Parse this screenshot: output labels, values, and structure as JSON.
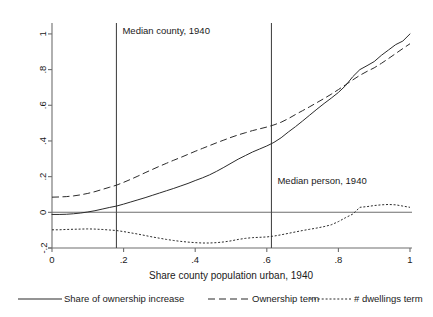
{
  "chart_data": {
    "type": "line",
    "title": "",
    "xlabel": "Share county population urban, 1940",
    "ylabel": "",
    "xlim": [
      0,
      1
    ],
    "ylim": [
      -0.2,
      1.05
    ],
    "grid": false,
    "legend_position": "bottom",
    "xticks": [
      "0",
      ".2",
      ".4",
      ".6",
      ".8",
      "1"
    ],
    "xtick_values": [
      0,
      0.2,
      0.4,
      0.6,
      0.8,
      1
    ],
    "yticks": [
      "-.2",
      "0",
      ".2",
      ".4",
      ".6",
      ".8",
      "1"
    ],
    "ytick_values": [
      -0.2,
      0,
      0.2,
      0.4,
      0.6,
      0.8,
      1
    ],
    "zero_line": 0,
    "annotations": [
      {
        "label": "Median county, 1940",
        "x": 0.18,
        "line": true
      },
      {
        "label": "Median person, 1940",
        "x": 0.613,
        "line": true
      }
    ],
    "x": [
      0,
      0.02,
      0.04,
      0.06,
      0.08,
      0.1,
      0.12,
      0.14,
      0.16,
      0.18,
      0.2,
      0.22,
      0.24,
      0.26,
      0.28,
      0.3,
      0.32,
      0.34,
      0.36,
      0.38,
      0.4,
      0.42,
      0.44,
      0.46,
      0.48,
      0.5,
      0.52,
      0.54,
      0.56,
      0.58,
      0.6,
      0.62,
      0.64,
      0.66,
      0.68,
      0.7,
      0.72,
      0.74,
      0.76,
      0.78,
      0.8,
      0.82,
      0.84,
      0.86,
      0.88,
      0.9,
      0.92,
      0.94,
      0.96,
      0.98,
      1
    ],
    "series": [
      {
        "name": "Share of ownership increase",
        "style": "solid",
        "values": [
          -0.012,
          -0.012,
          -0.011,
          -0.008,
          -0.004,
          0.002,
          0.009,
          0.018,
          0.027,
          0.035,
          0.046,
          0.058,
          0.07,
          0.082,
          0.095,
          0.108,
          0.121,
          0.134,
          0.148,
          0.162,
          0.178,
          0.193,
          0.21,
          0.23,
          0.252,
          0.275,
          0.298,
          0.318,
          0.338,
          0.355,
          0.372,
          0.392,
          0.418,
          0.45,
          0.48,
          0.512,
          0.545,
          0.578,
          0.61,
          0.64,
          0.672,
          0.71,
          0.76,
          0.8,
          0.822,
          0.845,
          0.88,
          0.91,
          0.94,
          0.96,
          1.0
        ]
      },
      {
        "name": "Ownership term",
        "style": "dashed",
        "values": [
          0.085,
          0.086,
          0.088,
          0.092,
          0.098,
          0.106,
          0.116,
          0.128,
          0.14,
          0.152,
          0.168,
          0.185,
          0.203,
          0.222,
          0.24,
          0.258,
          0.275,
          0.292,
          0.308,
          0.325,
          0.342,
          0.358,
          0.374,
          0.39,
          0.405,
          0.42,
          0.434,
          0.446,
          0.458,
          0.468,
          0.478,
          0.49,
          0.505,
          0.525,
          0.548,
          0.57,
          0.592,
          0.615,
          0.638,
          0.662,
          0.688,
          0.715,
          0.742,
          0.768,
          0.79,
          0.81,
          0.835,
          0.862,
          0.89,
          0.918,
          0.945
        ]
      },
      {
        "name": "# dwellings term",
        "style": "dotted",
        "values": [
          -0.098,
          -0.098,
          -0.096,
          -0.095,
          -0.094,
          -0.093,
          -0.094,
          -0.096,
          -0.099,
          -0.102,
          -0.108,
          -0.115,
          -0.122,
          -0.13,
          -0.138,
          -0.145,
          -0.152,
          -0.158,
          -0.163,
          -0.167,
          -0.17,
          -0.172,
          -0.172,
          -0.17,
          -0.166,
          -0.16,
          -0.152,
          -0.146,
          -0.142,
          -0.14,
          -0.138,
          -0.133,
          -0.126,
          -0.118,
          -0.11,
          -0.102,
          -0.095,
          -0.088,
          -0.08,
          -0.07,
          -0.052,
          -0.03,
          -0.01,
          0.028,
          0.032,
          0.038,
          0.042,
          0.044,
          0.042,
          0.035,
          0.028
        ]
      }
    ]
  },
  "legend": {
    "items": [
      {
        "label": "Share of ownership increase",
        "style": "solid"
      },
      {
        "label": "Ownership term",
        "style": "dashed"
      },
      {
        "label": "# dwellings term",
        "style": "dotted"
      }
    ]
  }
}
